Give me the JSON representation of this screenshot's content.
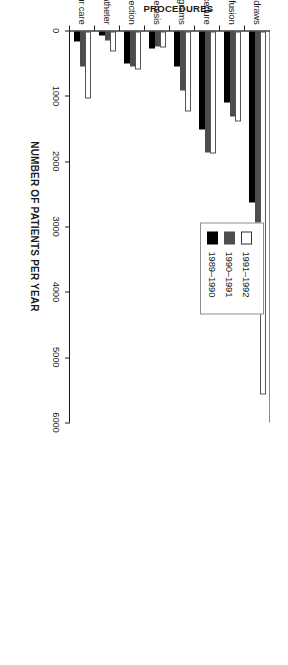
{
  "chart_data": {
    "type": "bar",
    "orientation": "horizontal-rotated",
    "title": "",
    "xlabel": "NUMBER OF PATIENTS PER YEAR",
    "ylabel": "PROCEDURES",
    "xlim": [
      0,
      6000
    ],
    "xticks": [
      0,
      1000,
      2000,
      3000,
      4000,
      5000,
      6000
    ],
    "xtick_labels": [
      "0",
      "1000",
      "2000",
      "3000",
      "4000",
      "5000",
      "6000"
    ],
    "grid": false,
    "legend_position": "upper-right",
    "categories": [
      "IV infusions/blood draws",
      "blood product transfusion",
      "cardiac/angio procedure",
      "bronchoscopies/biopsies/myelograms",
      "therapeutic pheresis",
      "mononuclear cell collection",
      "peripheral IV/central catheter",
      "23-hour care"
    ],
    "series": [
      {
        "name": "1991–1992",
        "color": "#ffffff",
        "values": [
          5550,
          1370,
          1860,
          1230,
          250,
          580,
          300,
          1030
        ]
      },
      {
        "name": "1990–1991",
        "color": "#4d4d4d",
        "values": [
          3960,
          1300,
          1850,
          900,
          230,
          540,
          140,
          530
        ]
      },
      {
        "name": "1989–1990",
        "color": "#000000",
        "values": [
          2620,
          1080,
          1500,
          540,
          260,
          490,
          60,
          160
        ]
      }
    ]
  },
  "legend": {
    "entries": [
      {
        "label": "1991–1992",
        "swatch": "white"
      },
      {
        "label": "1990–1991",
        "swatch": "dark-gray"
      },
      {
        "label": "1989–1990",
        "swatch": "black"
      }
    ]
  },
  "axes": {
    "value_axis_title": "NUMBER OF PATIENTS PER YEAR",
    "category_axis_title": "PROCEDURES"
  }
}
